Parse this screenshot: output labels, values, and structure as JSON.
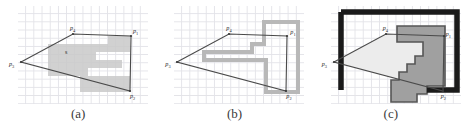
{
  "figure": {
    "panels": [
      {
        "id": "panel-a",
        "caption": "(a)",
        "grid": {
          "visible": true,
          "cell_px": 8.2,
          "color": "#e3e3e8"
        },
        "region": {
          "name": "light-gray-comb-region",
          "fill": "#c9c9c9",
          "stroke": "none",
          "style": "filled"
        },
        "triangle": {
          "stroke": "#4a4a4a",
          "fill": "none",
          "vertices": [
            {
              "label": "p3",
              "base": "p",
              "sub": "3",
              "x": 3,
              "y": 56
            },
            {
              "label": "p4",
              "base": "p",
              "sub": "4",
              "x": 55,
              "y": 28
            },
            {
              "label": "p1",
              "base": "p",
              "sub": "1",
              "x": 113,
              "y": 30
            },
            {
              "label": "p2",
              "base": "p",
              "sub": "2",
              "x": 112,
              "y": 85
            }
          ]
        },
        "interior_marker": {
          "label": "s",
          "x": 48,
          "y": 46
        }
      },
      {
        "id": "panel-b",
        "caption": "(b)",
        "grid": {
          "visible": true,
          "cell_px": 8.2,
          "color": "#e3e3e8"
        },
        "region": {
          "name": "gray-outline-region",
          "fill": "none",
          "stroke": "#b8b8b8",
          "stroke_width": 4,
          "style": "outline"
        },
        "triangle": {
          "stroke": "#4a4a4a",
          "fill": "none",
          "vertices": [
            {
              "label": "p3",
              "base": "p",
              "sub": "3",
              "x": 3,
              "y": 56
            },
            {
              "label": "p4",
              "base": "p",
              "sub": "4",
              "x": 55,
              "y": 28
            },
            {
              "label": "p1",
              "base": "p",
              "sub": "1",
              "x": 113,
              "y": 30
            },
            {
              "label": "p2",
              "base": "p",
              "sub": "2",
              "x": 112,
              "y": 85
            }
          ]
        }
      },
      {
        "id": "panel-c",
        "caption": "(c)",
        "grid": {
          "visible": true,
          "cell_px": 8.2,
          "color": "#e3e3e8"
        },
        "outer_border": {
          "name": "black-bounding-frame",
          "stroke": "#1a1a1a",
          "stroke_width": 6
        },
        "region": {
          "name": "dark-gray-staircase-region",
          "fill": "#a0a0a0",
          "stroke": "#555555",
          "stroke_width": 2,
          "style": "filled-outlined"
        },
        "shadow_region": {
          "name": "light-triangle-shadow",
          "fill": "#e8e8e8"
        },
        "triangle": {
          "stroke": "#4a4a4a",
          "fill": "none",
          "vertices": [
            {
              "label": "p3",
              "base": "p",
              "sub": "3",
              "x": 3,
              "y": 56
            },
            {
              "label": "p4",
              "base": "p",
              "sub": "4",
              "x": 55,
              "y": 28
            },
            {
              "label": "p1",
              "base": "p",
              "sub": "1",
              "x": 113,
              "y": 30
            },
            {
              "label": "p2",
              "base": "p",
              "sub": "2",
              "x": 112,
              "y": 85
            }
          ]
        }
      }
    ]
  }
}
